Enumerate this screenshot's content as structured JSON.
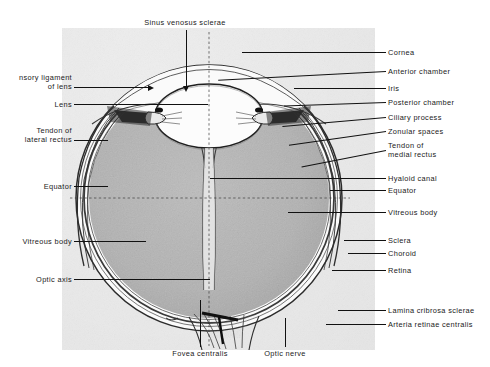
{
  "figure": {
    "title_top": "Sinus venosus sclerae",
    "colors": {
      "ink": "#1a1a1a",
      "plate_background": "#f2f2f2",
      "vitreous_gray": "#b3b3b3",
      "sclera_white": "#fafafa",
      "page_background": "#ffffff"
    }
  },
  "labels_top": [
    {
      "text": "Sinus venosus sclerae"
    }
  ],
  "labels_left": [
    {
      "line1": "nsory ligament",
      "line2": "of lens"
    },
    {
      "line1": "Lens"
    },
    {
      "line1": "Tendon of",
      "line2": "lateral rectus"
    },
    {
      "line1": "Equator"
    },
    {
      "line1": "Vitreous body"
    },
    {
      "line1": "Optic axis"
    }
  ],
  "labels_right": [
    {
      "line1": "Cornea"
    },
    {
      "line1": "Anterior chamber"
    },
    {
      "line1": "Iris"
    },
    {
      "line1": "Posterior chamber"
    },
    {
      "line1": "Ciliary process"
    },
    {
      "line1": "Zonular spaces"
    },
    {
      "line1": "Tendon of",
      "line2": "medial rectus"
    },
    {
      "line1": "Hyaloid canal"
    },
    {
      "line1": "Equator"
    },
    {
      "line1": "Vitreous body"
    },
    {
      "line1": "Sclera"
    },
    {
      "line1": "Choroid"
    },
    {
      "line1": "Retina"
    },
    {
      "line1": "Lamina cribrosa sclerae"
    },
    {
      "line1": "Arteria retinae centralis"
    }
  ],
  "labels_bottom": [
    {
      "text": "Fovea centralis"
    },
    {
      "text": "Optic nerve"
    }
  ]
}
